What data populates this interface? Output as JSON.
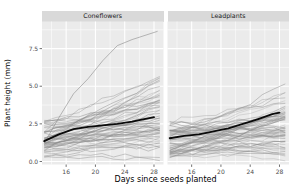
{
  "figure": {
    "width": 292,
    "height": 194,
    "background": "#ffffff"
  },
  "chart_data": {
    "type": "line",
    "title": "",
    "xlabel": "Days since seeds planted",
    "ylabel": "Plant height (mm)",
    "legend": "none",
    "grid": "on",
    "x_ticks": [
      16,
      20,
      24,
      28
    ],
    "x_minor_ticks": [
      14,
      18,
      22,
      26
    ],
    "y_ticks": [
      0.0,
      2.5,
      5.0,
      7.5
    ],
    "y_tick_labels": [
      "0.0",
      "2.5",
      "5.0",
      "7.5"
    ],
    "y_minor_ticks": [
      1.25,
      3.75,
      6.25,
      8.75
    ],
    "x_domain": [
      12.7,
      29.3
    ],
    "y_domain": [
      -0.2,
      9.3
    ],
    "facets": [
      {
        "label": "Coneflowers",
        "mean_line": {
          "name": "mean plant height",
          "x": [
            13,
            15,
            17,
            19,
            21,
            23,
            25,
            27,
            28
          ],
          "y": [
            1.35,
            1.8,
            2.15,
            2.3,
            2.4,
            2.5,
            2.65,
            2.85,
            2.95
          ]
        },
        "outlier_line": {
          "x": [
            13,
            15,
            17,
            19,
            21,
            23,
            25,
            28.5
          ],
          "y": [
            1.2,
            2.9,
            4.5,
            5.5,
            6.7,
            7.7,
            8.1,
            8.65
          ]
        },
        "spaghetti": {
          "description": "individual seedling growth trajectories",
          "n": 58,
          "seed": 7,
          "start_range": [
            0.3,
            2.7
          ],
          "growth_range": [
            -0.2,
            3.9
          ],
          "noise": 0.18,
          "x_start": 13,
          "x_end": 28.8,
          "points": 11
        }
      },
      {
        "label": "Leadplants",
        "mean_line": {
          "name": "mean plant height",
          "x": [
            13,
            15,
            17,
            19,
            21,
            23,
            25,
            27,
            28
          ],
          "y": [
            1.55,
            1.7,
            1.8,
            2.0,
            2.2,
            2.5,
            2.8,
            3.15,
            3.25
          ]
        },
        "spaghetti": {
          "description": "individual seedling growth trajectories",
          "n": 62,
          "seed": 13,
          "start_range": [
            0.3,
            2.6
          ],
          "growth_range": [
            -0.5,
            3.0
          ],
          "noise": 0.18,
          "x_start": 13,
          "x_end": 28.8,
          "points": 11
        }
      }
    ],
    "colors": {
      "panel_bg": "#ebebeb",
      "strip_bg": "#d9d9d9",
      "grid": "#ffffff",
      "spaghetti_line": "#8c8c8c",
      "mean_line": "#0a0a0a",
      "tick_text": "#4d4d4d",
      "tick_mark": "#333333",
      "axis_text": "#000000",
      "strip_text": "#1a1a1a"
    }
  }
}
